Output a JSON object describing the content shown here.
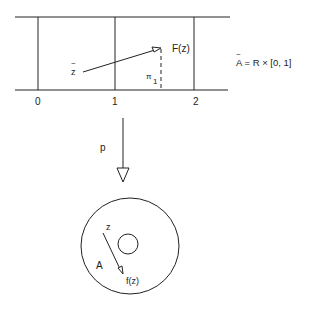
{
  "strip": {
    "tick_labels": [
      "0",
      "1",
      "2"
    ],
    "point_label": "z",
    "point_tilde": "~",
    "image_label": "F(z)",
    "projection_label": "π",
    "projection_subscript": "1",
    "space_equation": "A = R × [0, 1]",
    "space_tilde": "~"
  },
  "map": {
    "label": "p"
  },
  "annulus": {
    "region_label": "A",
    "point_label": "z",
    "image_label": "f(z)"
  },
  "colors": {
    "ink": "#222222",
    "background": "#ffffff"
  }
}
